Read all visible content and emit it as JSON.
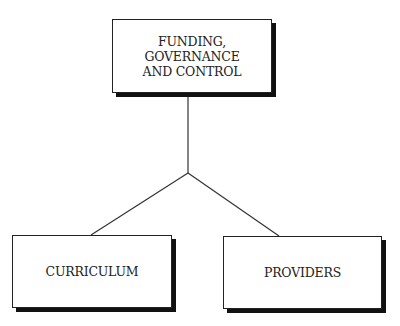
{
  "diagram": {
    "type": "hierarchy",
    "root": {
      "lines": [
        "FUNDING,",
        "GOVERNANCE",
        "AND CONTROL"
      ]
    },
    "children": [
      {
        "label": "CURRICULUM"
      },
      {
        "label": "PROVIDERS"
      }
    ],
    "colors": {
      "stroke": "#222222",
      "shadow": "#111111",
      "fill": "#ffffff"
    }
  }
}
